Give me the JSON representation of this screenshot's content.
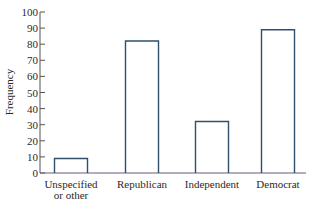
{
  "chart_data": {
    "type": "bar",
    "title": "",
    "xlabel": "",
    "ylabel": "Frequency",
    "categories": [
      "Unspecified\nor other",
      "Republican",
      "Independent",
      "Democrat"
    ],
    "category_lines": [
      [
        "Unspecified",
        "or other"
      ],
      [
        "Republican"
      ],
      [
        "Independent"
      ],
      [
        "Democrat"
      ]
    ],
    "values": [
      9,
      82,
      32,
      89
    ],
    "ylim": [
      0,
      100
    ],
    "yticks": [
      0,
      10,
      20,
      30,
      40,
      50,
      60,
      70,
      80,
      90,
      100
    ],
    "grid": false,
    "legend": null,
    "style": {
      "bar_fill": "none",
      "bar_stroke": "#2f4f6a",
      "axis_color": "#555555",
      "baseline_color": "#6a5a7a"
    }
  }
}
